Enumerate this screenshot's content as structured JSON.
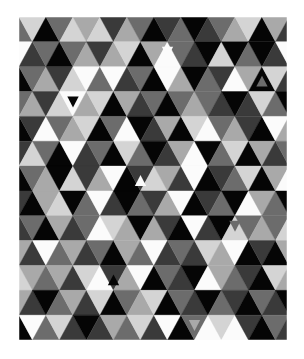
{
  "artwork": {
    "description": "Geometric grayscale triangle mosaic",
    "rows": 13,
    "triangles_per_row": 21,
    "first_triangle_orientation": "alternates_by_row",
    "palette": {
      "0": "#050505",
      "1": "#3a3a3a",
      "2": "#6c6c6c",
      "3": "#a9a9a9",
      "4": "#d4d4d4",
      "5": "#fbfbfb"
    },
    "shade_grid": [
      [
        2,
        4,
        0,
        2,
        4,
        3,
        4,
        1,
        3,
        2,
        0,
        1,
        2,
        0,
        1,
        2,
        3,
        4,
        0,
        3,
        1
      ],
      [
        5,
        1,
        2,
        0,
        2,
        3,
        1,
        3,
        4,
        0,
        3,
        5,
        2,
        1,
        0,
        4,
        0,
        2,
        0,
        1,
        5
      ],
      [
        0,
        2,
        3,
        1,
        4,
        5,
        2,
        5,
        1,
        2,
        0,
        5,
        3,
        0,
        2,
        1,
        5,
        3,
        0,
        4,
        1
      ],
      [
        2,
        3,
        1,
        4,
        5,
        3,
        4,
        0,
        3,
        1,
        2,
        0,
        2,
        3,
        2,
        1,
        0,
        1,
        4,
        2,
        0
      ],
      [
        0,
        1,
        5,
        2,
        3,
        4,
        0,
        2,
        5,
        0,
        1,
        3,
        0,
        4,
        5,
        2,
        3,
        1,
        0,
        5,
        3
      ],
      [
        1,
        4,
        2,
        0,
        5,
        1,
        2,
        0,
        4,
        2,
        0,
        1,
        3,
        5,
        0,
        2,
        4,
        0,
        3,
        1,
        2
      ],
      [
        0,
        2,
        3,
        0,
        4,
        1,
        3,
        5,
        0,
        1,
        4,
        3,
        1,
        5,
        0,
        1,
        2,
        4,
        0,
        3,
        5
      ],
      [
        1,
        0,
        3,
        4,
        0,
        2,
        5,
        1,
        0,
        2,
        1,
        3,
        5,
        0,
        1,
        2,
        0,
        5,
        3,
        2,
        0
      ],
      [
        1,
        2,
        0,
        3,
        1,
        2,
        5,
        4,
        3,
        0,
        3,
        1,
        0,
        5,
        1,
        0,
        4,
        2,
        3,
        2,
        4
      ],
      [
        3,
        1,
        5,
        2,
        3,
        1,
        2,
        0,
        3,
        2,
        5,
        1,
        2,
        1,
        4,
        3,
        5,
        0,
        1,
        0,
        3
      ],
      [
        4,
        3,
        2,
        3,
        1,
        4,
        5,
        1,
        3,
        5,
        0,
        2,
        1,
        0,
        5,
        3,
        2,
        1,
        0,
        4,
        3
      ],
      [
        3,
        1,
        0,
        2,
        3,
        1,
        4,
        0,
        2,
        3,
        4,
        0,
        2,
        1,
        0,
        2,
        1,
        0,
        2,
        1,
        0
      ],
      [
        0,
        5,
        2,
        4,
        1,
        0,
        1,
        3,
        2,
        4,
        1,
        5,
        0,
        2,
        5,
        4,
        5,
        1,
        0,
        2,
        1
      ]
    ],
    "insets": [
      {
        "row": 1,
        "col": 11,
        "shade": "5",
        "orientation": "down"
      },
      {
        "row": 3,
        "col": 4,
        "shade": "0",
        "orientation": "down"
      },
      {
        "row": 6,
        "col": 9,
        "shade": "5",
        "orientation": "up"
      },
      {
        "row": 2,
        "col": 18,
        "shade": "2",
        "orientation": "up"
      },
      {
        "row": 8,
        "col": 16,
        "shade": "2",
        "orientation": "down"
      },
      {
        "row": 10,
        "col": 7,
        "shade": "0",
        "orientation": "up"
      },
      {
        "row": 12,
        "col": 13,
        "shade": "3",
        "orientation": "down"
      }
    ]
  }
}
